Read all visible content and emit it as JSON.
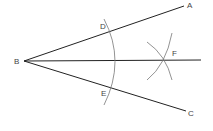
{
  "diagram": {
    "colors": {
      "line": "#222222",
      "arc": "#777777",
      "label": "#444444",
      "background": "#ffffff"
    },
    "points": {
      "B": {
        "label": "B",
        "x": 24,
        "y": 61
      },
      "A": {
        "label": "A",
        "x": 184,
        "y": 6
      },
      "C": {
        "label": "C",
        "x": 186,
        "y": 111
      },
      "D": {
        "label": "D",
        "x": 111,
        "y": 31
      },
      "E": {
        "label": "E",
        "x": 110,
        "y": 89
      },
      "F": {
        "label": "F",
        "x": 165,
        "y": 60
      }
    },
    "labels": {
      "A": "A",
      "B": "B",
      "C": "C",
      "D": "D",
      "E": "E",
      "F": "F"
    },
    "rays": [
      {
        "name": "ray-BA",
        "from": "B",
        "to": "A"
      },
      {
        "name": "ray-BC",
        "from": "B",
        "to": "C"
      },
      {
        "name": "ray-BF",
        "from": "B",
        "to": "F",
        "extends_to_x": 201
      }
    ],
    "arcs": [
      {
        "name": "arc-DE",
        "center": "B"
      },
      {
        "name": "arc-from-D",
        "center": "D"
      },
      {
        "name": "arc-from-E",
        "center": "E"
      }
    ]
  }
}
